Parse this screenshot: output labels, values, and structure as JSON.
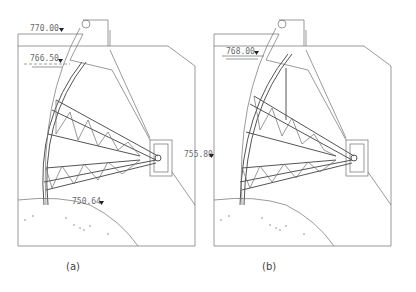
{
  "figure": {
    "panels": [
      {
        "id": "a",
        "caption": "(a)",
        "elevations": [
          {
            "label": "770.00",
            "role": "top-of-structure"
          },
          {
            "label": "766.50",
            "role": "water-level"
          },
          {
            "label": "755.80",
            "role": "trunnion-elevation"
          },
          {
            "label": "750.64",
            "role": "sill-elevation"
          }
        ]
      },
      {
        "id": "b",
        "caption": "(b)",
        "elevations": [
          {
            "label": "768.00",
            "role": "water-level"
          }
        ]
      }
    ],
    "colors": {
      "line": "#6e6e6e",
      "text": "#6a6a6a",
      "background": "#ffffff"
    }
  }
}
